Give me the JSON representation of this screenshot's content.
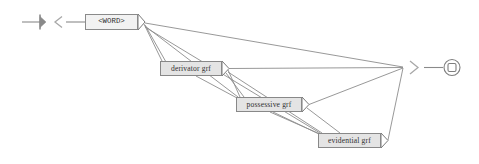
{
  "diagram": {
    "type": "transition-network",
    "colors": {
      "edge": "#8c8c8c",
      "node_fill": "#e4e4e4",
      "node_border": "#888888",
      "word_node_fill": "#f2f2f2",
      "marker": "#8a8a8a",
      "background": "#ffffff",
      "text": "#303030"
    },
    "start_marker": {
      "name": "start-marker",
      "glyph": "bar-arrow",
      "x": 22,
      "y": 22
    },
    "entry_chevron": {
      "name": "entry-chevron",
      "glyph": "<",
      "x": 57,
      "y": 22
    },
    "exit_chevron": {
      "name": "exit-chevron",
      "glyph": ">",
      "x": 414,
      "y": 66
    },
    "end_marker": {
      "name": "end-marker",
      "glyph": "circled-square",
      "x": 452,
      "y": 68
    },
    "nodes": [
      {
        "id": "word",
        "label": "<WORD>",
        "x": 85,
        "y": 14,
        "w": 53,
        "h": 16,
        "kind": "word"
      },
      {
        "id": "derivator",
        "label": "derivator grf",
        "x": 160,
        "y": 61,
        "w": 62,
        "h": 15,
        "kind": "sub"
      },
      {
        "id": "possessive",
        "label": "possessive grf",
        "x": 236,
        "y": 97,
        "w": 66,
        "h": 15,
        "kind": "sub"
      },
      {
        "id": "evidential",
        "label": "evidential grf",
        "x": 318,
        "y": 133,
        "w": 63,
        "h": 15,
        "kind": "sub"
      }
    ],
    "edges": [
      {
        "from": "start",
        "to": "word",
        "label": ""
      },
      {
        "from": "word",
        "to": "exit",
        "label": ""
      },
      {
        "from": "word",
        "to": "derivator",
        "label": ""
      },
      {
        "from": "word",
        "to": "possessive",
        "label": ""
      },
      {
        "from": "word",
        "to": "evidential",
        "label": ""
      },
      {
        "from": "derivator",
        "to": "exit",
        "label": ""
      },
      {
        "from": "derivator",
        "to": "possessive",
        "label": ""
      },
      {
        "from": "derivator",
        "to": "evidential",
        "label": ""
      },
      {
        "from": "possessive",
        "to": "exit",
        "label": ""
      },
      {
        "from": "possessive",
        "to": "evidential",
        "label": ""
      },
      {
        "from": "evidential",
        "to": "exit",
        "label": ""
      }
    ]
  }
}
